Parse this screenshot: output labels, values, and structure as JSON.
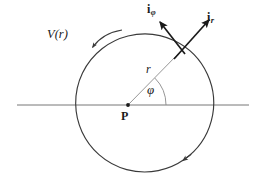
{
  "figure": {
    "background_color": "#ffffff",
    "stroke_color": "#3a3a3a",
    "axis_color": "#555555",
    "vector_color": "#1a1a1a",
    "labels": {
      "velocity": "V(r)",
      "radius": "r",
      "angle": "φ",
      "center_point": "P",
      "unit_vector_phi_base": "i",
      "unit_vector_phi_sub": "φ",
      "unit_vector_r_base": "i",
      "unit_vector_r_sub": "r"
    },
    "geometry": {
      "center": {
        "x": 128,
        "y": 105
      },
      "circle_radius": 69,
      "angle_arc_radius": 38,
      "angle_degrees": 45,
      "horizontal_axis": {
        "x1": 17,
        "x2": 249,
        "y": 105
      },
      "point_on_circle": {
        "x": 177,
        "y": 56
      },
      "vector_ir_tip": {
        "x": 209,
        "y": 20
      },
      "vector_iphi_tip": {
        "x": 160,
        "y": 22
      },
      "circle_direction": "counterclockwise"
    }
  }
}
